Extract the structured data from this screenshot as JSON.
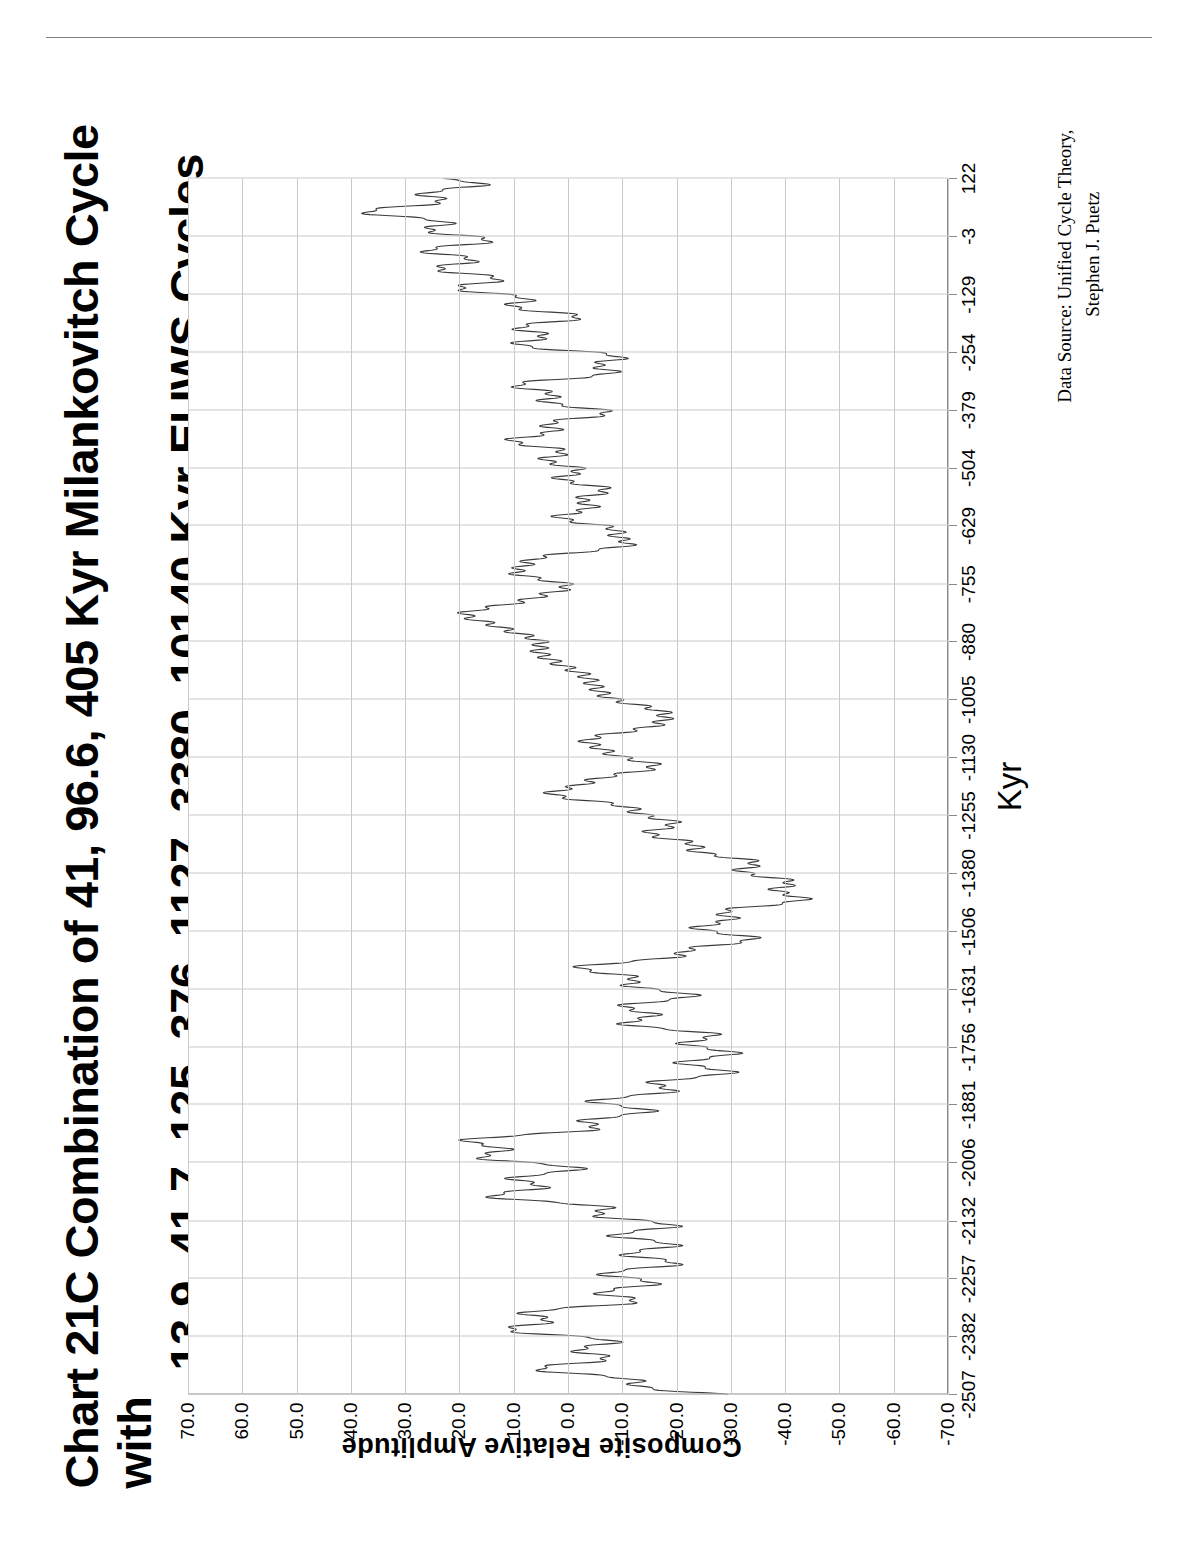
{
  "chart_data": {
    "type": "line",
    "title": "Chart 21C   Combination of 41, 96.6, 405 Kyr Milankovitch Cycle with 13.9, 41.7, 125, 376, 1127, 3380, 10140 Kyr EUWS Cycles",
    "title_line1": "Chart 21C   Combination of 41, 96.6, 405 Kyr Milankovitch Cycle with",
    "title_line2": "13.9, 41.7, 125, 376, 1127, 3380, 10140 Kyr EUWS Cycles",
    "xlabel": "Kyr",
    "ylabel": "Composite Relative Amplitude",
    "xlim": [
      -2507,
      122
    ],
    "ylim": [
      -70.0,
      70.0
    ],
    "grid": true,
    "legend": false,
    "orientation": "rotated-90-ccw",
    "xticks": [
      -2507,
      -2382,
      -2257,
      -2132,
      -2006,
      -1881,
      -1756,
      -1631,
      -1506,
      -1380,
      -1255,
      -1130,
      -1005,
      -880,
      -755,
      -629,
      -504,
      -379,
      -254,
      -129,
      -3,
      122
    ],
    "xticklabels": [
      "-2507",
      "-2382",
      "-2257",
      "-2132",
      "-2006",
      "-1881",
      "-1756",
      "-1631",
      "-1506",
      "-1380",
      "-1255",
      "-1130",
      "-1005",
      "-880",
      "-755",
      "-629",
      "-504",
      "-379",
      "-254",
      "-129",
      "-3",
      "122"
    ],
    "yticks": [
      70.0,
      60.0,
      50.0,
      40.0,
      30.0,
      20.0,
      10.0,
      0.0,
      -10.0,
      -20.0,
      -30.0,
      -40.0,
      -50.0,
      -60.0,
      -70.0
    ],
    "yticklabels": [
      "70.0",
      "60.0",
      "50.0",
      "40.0",
      "30.0",
      "20.0",
      "10.0",
      "0.0",
      "-10.0",
      "-20.0",
      "-30.0",
      "-40.0",
      "-50.0",
      "-60.0",
      "-70.0"
    ],
    "series": [
      {
        "name": "Composite Relative Amplitude",
        "color": "#3a3a3a",
        "description": "Composite of 41, 96.6, 405 Kyr Milankovitch cycles and 13.9, 41.7, 125, 376, 1127, 3380, 10140 Kyr EUWS cycles",
        "components_kyr": [
          41,
          96.6,
          405,
          13.9,
          41.7,
          125,
          376,
          1127,
          3380,
          10140
        ],
        "sample_step_kyr": 1,
        "observed_range": [
          -45,
          38
        ],
        "notes": "Dense high-frequency composite waveform; largest positive excursion near -880 Kyr reaching about +33; strongest negative excursions near -370 Kyr and -2500 Kyr reaching about -42."
      }
    ],
    "credit": {
      "line1": "Data Source:   Unified Cycle Theory,",
      "line2": "Stephen J. Puetz"
    },
    "colors": {
      "line": "#3a3a3a",
      "grid": "#c9c9c9",
      "axis": "#8a8a8a",
      "frame": "#000000",
      "background": "#ffffff"
    }
  }
}
